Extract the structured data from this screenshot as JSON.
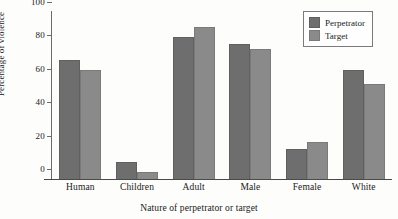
{
  "chart_data": {
    "type": "bar",
    "title": "",
    "subtitle": "",
    "xlabel": "Nature of perpetrator or target",
    "ylabel": "Percentage of violence",
    "categories": [
      "Human",
      "Children",
      "Adult",
      "Male",
      "Female",
      "White"
    ],
    "series": [
      {
        "name": "Perpetrator",
        "color": "#6e6e6e",
        "values": [
          71,
          10,
          85,
          81,
          18,
          65
        ]
      },
      {
        "name": "Target",
        "color": "#8a8a8a",
        "values": [
          65,
          4,
          91,
          78,
          22,
          57
        ]
      }
    ],
    "ylim": [
      0,
      100
    ],
    "yticks": [
      0,
      20,
      40,
      60,
      80,
      100
    ],
    "ytick_labels": [
      "0",
      "20",
      "40",
      "60",
      "80",
      "100"
    ],
    "grid": false,
    "legend_position": "top-right",
    "legend_entries": [
      "Perpetrator",
      "Target"
    ]
  }
}
